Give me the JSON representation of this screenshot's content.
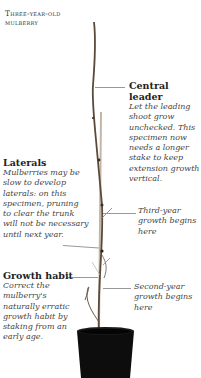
{
  "title": {
    "line1": "Three-year-old",
    "line2": "mulberry"
  },
  "annotations": [
    {
      "id": "central-leader",
      "heading": "Central leader",
      "body": [
        "Let the leading",
        "shoot grow",
        "unchecked. This",
        "specimen now",
        "needs a longer",
        "stake to keep",
        "extension growth",
        "vertical."
      ]
    },
    {
      "id": "laterals",
      "heading": "Laterals",
      "body": [
        "Mulberries may be",
        "slow to develop",
        "laterals: on this",
        "specimen, pruning",
        "to clear the trunk",
        "will not be necessary",
        "until next year."
      ]
    },
    {
      "id": "third-year",
      "heading": "",
      "body": [
        "Third-year",
        "growth begins",
        "here"
      ]
    },
    {
      "id": "growth-habit",
      "heading": "Growth habit",
      "body": [
        "Correct the",
        "mulberry's",
        "naturally erratic",
        "growth habit by",
        "staking from an",
        "early age."
      ]
    },
    {
      "id": "second-year",
      "heading": "",
      "body": [
        "Second-year",
        "growth begins",
        "here"
      ]
    }
  ],
  "colors": {
    "stem": "#5a4a3c",
    "stake": "#b9ad9c",
    "pot": "#0d0d0d",
    "leader_line": "#999999"
  }
}
